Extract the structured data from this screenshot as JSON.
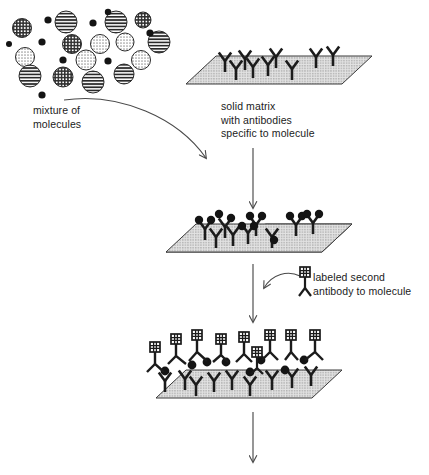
{
  "figure": {
    "width": 429,
    "height": 475,
    "background": "#ffffff",
    "ink": "#1b1b1b",
    "matrix_fill": "#d9d9d9",
    "matrix_stroke": "#3a3a3a",
    "arrow_color": "#4a4a4a"
  },
  "captions": {
    "mixture": "mixture of\nmolecules",
    "matrix": "solid matrix\nwith antibodies\nspecific to molecule",
    "labeled_antibody": "labeled second\nantibody to molecule",
    "bottom_cutoff": ""
  },
  "stages": [
    {
      "id": "stage-1-matrix",
      "name": "solid matrix with antibodies",
      "antibody_count": 9,
      "bound_molecules": 0
    },
    {
      "id": "stage-2-capture",
      "name": "molecules captured by antibodies",
      "antibody_count": 9,
      "bound_molecules": 11
    },
    {
      "id": "stage-3-detection",
      "name": "labeled second antibodies bound to captured molecules",
      "antibody_count": 9,
      "bound_molecules": 8,
      "labels": 9
    }
  ],
  "icons": {
    "antibody": "antibody-y-icon",
    "molecule": "molecule-dot-icon",
    "label_tag": "label-tag-icon",
    "arrow_down": "arrow-down-icon",
    "arrow_curved": "arrow-curved-icon"
  },
  "molecules": {
    "note": "mixture of heterogeneous molecules drawn as patterned circles and solid dots",
    "pattern_types": [
      "horizontal-stripe",
      "crosshatch",
      "light-stipple",
      "solid-dot"
    ],
    "patterned_count": 17,
    "solid_dot_count": 9
  },
  "molecule_cluster": [
    {
      "cx": 22,
      "cy": 28,
      "r": 9.5,
      "fill": "crosshatch"
    },
    {
      "cx": 48,
      "cy": 20,
      "r": 3.6,
      "fill": "solid"
    },
    {
      "cx": 66,
      "cy": 22,
      "r": 11,
      "fill": "stripe"
    },
    {
      "cx": 93,
      "cy": 23,
      "r": 3.6,
      "fill": "solid"
    },
    {
      "cx": 116,
      "cy": 22,
      "r": 11,
      "fill": "stripe"
    },
    {
      "cx": 143,
      "cy": 20,
      "r": 8,
      "fill": "crosshatch"
    },
    {
      "cx": 42,
      "cy": 42,
      "r": 3.6,
      "fill": "solid"
    },
    {
      "cx": 72,
      "cy": 44,
      "r": 9.5,
      "fill": "crosshatch"
    },
    {
      "cx": 100,
      "cy": 44,
      "r": 9.5,
      "fill": "stipple"
    },
    {
      "cx": 125,
      "cy": 42,
      "r": 9,
      "fill": "stipple"
    },
    {
      "cx": 159,
      "cy": 42,
      "r": 11,
      "fill": "stripe"
    },
    {
      "cx": 25,
      "cy": 57,
      "r": 9.5,
      "fill": "stipple"
    },
    {
      "cx": 86,
      "cy": 60,
      "r": 10,
      "fill": "stipple"
    },
    {
      "cx": 63,
      "cy": 60,
      "r": 3.6,
      "fill": "solid"
    },
    {
      "cx": 108,
      "cy": 61,
      "r": 3.6,
      "fill": "solid"
    },
    {
      "cx": 141,
      "cy": 60,
      "r": 9.5,
      "fill": "stipple"
    },
    {
      "cx": 30,
      "cy": 76,
      "r": 11,
      "fill": "stripe"
    },
    {
      "cx": 63,
      "cy": 77,
      "r": 10,
      "fill": "crosshatch"
    },
    {
      "cx": 93,
      "cy": 82,
      "r": 11,
      "fill": "stripe"
    },
    {
      "cx": 124,
      "cy": 74,
      "r": 10,
      "fill": "stripe"
    },
    {
      "cx": 42,
      "cy": 95,
      "r": 3.6,
      "fill": "solid"
    },
    {
      "cx": 150,
      "cy": 33,
      "r": 3.6,
      "fill": "solid"
    }
  ]
}
